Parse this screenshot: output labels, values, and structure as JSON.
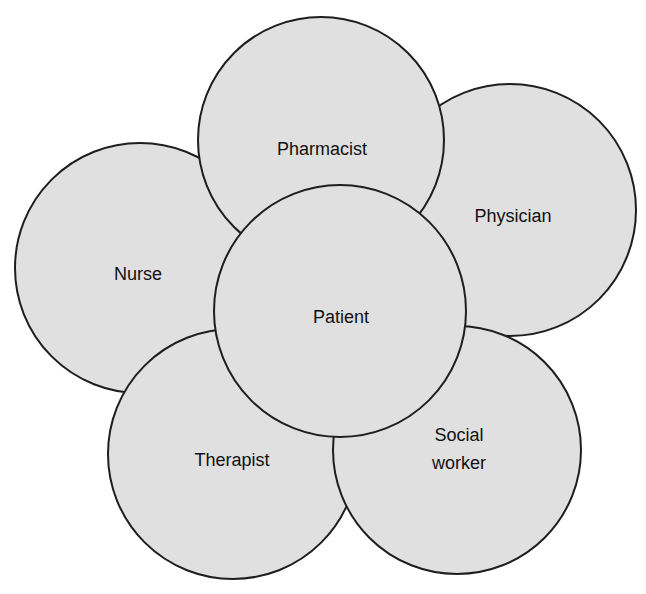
{
  "diagram": {
    "type": "overlapping-circles",
    "colors": {
      "fill": "#e0e0e0",
      "stroke": "#1e1e1e",
      "text": "#111111",
      "background": "#ffffff"
    },
    "nodes": [
      {
        "id": "nurse",
        "label": "Nurse",
        "lines": [
          "Nurse"
        ],
        "cx": 140,
        "cy": 268,
        "r": 125
      },
      {
        "id": "physician",
        "label": "Physician",
        "lines": [
          "Physician"
        ],
        "cx": 510,
        "cy": 210,
        "r": 126
      },
      {
        "id": "pharmacist",
        "label": "Pharmacist",
        "lines": [
          "Pharmacist"
        ],
        "cx": 321,
        "cy": 140,
        "r": 123
      },
      {
        "id": "therapist",
        "label": "Therapist",
        "lines": [
          "Therapist"
        ],
        "cx": 233,
        "cy": 454,
        "r": 125
      },
      {
        "id": "social-worker",
        "label": "Social worker",
        "lines": [
          "Social",
          "worker"
        ],
        "cx": 457,
        "cy": 450,
        "r": 124
      },
      {
        "id": "patient",
        "label": "Patient",
        "lines": [
          "Patient"
        ],
        "cx": 340,
        "cy": 311,
        "r": 126
      }
    ],
    "center": "Patient"
  }
}
